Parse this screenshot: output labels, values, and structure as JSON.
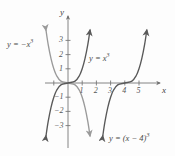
{
  "figure": {
    "background": "#fdfdfd"
  },
  "axes": {
    "x_label": "x",
    "y_label": "y",
    "x_ticks": [
      "1",
      "2",
      "3",
      "4",
      "5"
    ],
    "y_ticks_positive": [
      "1",
      "2",
      "3"
    ],
    "y_ticks_negative": [
      "−1",
      "−2",
      "−3"
    ],
    "xlim": [
      -1.6,
      6.2
    ],
    "ylim": [
      -4.0,
      4.2
    ],
    "origin_px": [
      68,
      83
    ],
    "unit_px": 14.2
  },
  "chart_data": {
    "type": "line",
    "title": "",
    "xlabel": "x",
    "ylabel": "y",
    "xlim": [
      -1.6,
      6.2
    ],
    "ylim": [
      -4.0,
      4.2
    ],
    "grid": false,
    "legend": "inline-labels",
    "series": [
      {
        "name": "y = −x³",
        "expression": "y = -x^3",
        "color": "#9a9a9a",
        "arrows": [
          "start",
          "end"
        ],
        "points": [
          {
            "x": -1.55,
            "y": 3.72
          },
          {
            "x": -1.4,
            "y": 2.74
          },
          {
            "x": -1.2,
            "y": 1.73
          },
          {
            "x": -1.0,
            "y": 1.0
          },
          {
            "x": -0.8,
            "y": 0.51
          },
          {
            "x": -0.5,
            "y": 0.13
          },
          {
            "x": 0.0,
            "y": 0.0
          },
          {
            "x": 0.5,
            "y": -0.13
          },
          {
            "x": 0.8,
            "y": -0.51
          },
          {
            "x": 1.0,
            "y": -1.0
          },
          {
            "x": 1.2,
            "y": -1.73
          },
          {
            "x": 1.4,
            "y": -2.74
          },
          {
            "x": 1.55,
            "y": -3.72
          }
        ]
      },
      {
        "name": "y = x³",
        "expression": "y = x^3",
        "color": "#595959",
        "arrows": [
          "start",
          "end"
        ],
        "points": [
          {
            "x": -1.55,
            "y": -3.72
          },
          {
            "x": -1.4,
            "y": -2.74
          },
          {
            "x": -1.2,
            "y": -1.73
          },
          {
            "x": -1.0,
            "y": -1.0
          },
          {
            "x": -0.8,
            "y": -0.51
          },
          {
            "x": -0.5,
            "y": -0.13
          },
          {
            "x": 0.0,
            "y": 0.0
          },
          {
            "x": 0.5,
            "y": 0.13
          },
          {
            "x": 0.8,
            "y": 0.51
          },
          {
            "x": 1.0,
            "y": 1.0
          },
          {
            "x": 1.2,
            "y": 1.73
          },
          {
            "x": 1.4,
            "y": 2.74
          },
          {
            "x": 1.55,
            "y": 3.72
          }
        ]
      },
      {
        "name": "y = (x − 4)³",
        "expression": "y = (x-4)^3",
        "color": "#595959",
        "arrows": [
          "start",
          "end"
        ],
        "points": [
          {
            "x": 2.45,
            "y": -3.72
          },
          {
            "x": 2.6,
            "y": -2.74
          },
          {
            "x": 2.8,
            "y": -1.73
          },
          {
            "x": 3.0,
            "y": -1.0
          },
          {
            "x": 3.2,
            "y": -0.51
          },
          {
            "x": 3.5,
            "y": -0.13
          },
          {
            "x": 4.0,
            "y": 0.0
          },
          {
            "x": 4.5,
            "y": 0.13
          },
          {
            "x": 4.8,
            "y": 0.51
          },
          {
            "x": 5.0,
            "y": 1.0
          },
          {
            "x": 5.2,
            "y": 1.73
          },
          {
            "x": 5.4,
            "y": 2.74
          },
          {
            "x": 5.55,
            "y": 3.72
          }
        ]
      }
    ]
  },
  "labels": {
    "neg_cube": {
      "base": "y = −x",
      "exp": "3"
    },
    "cube": {
      "base": "y = x",
      "exp": "3"
    },
    "shifted_cube": {
      "base": "y = (x − 4)",
      "exp": "3"
    }
  }
}
